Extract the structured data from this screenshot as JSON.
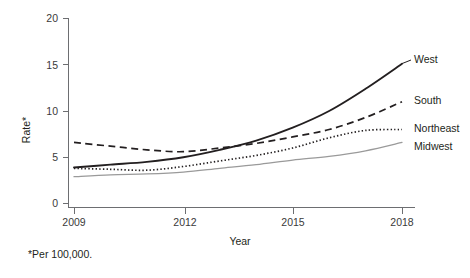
{
  "chart_data": {
    "type": "line",
    "title": "",
    "subtitle": "",
    "xlabel": "Year",
    "ylabel": "Rate*",
    "x": [
      2009,
      2010,
      2011,
      2012,
      2013,
      2014,
      2015,
      2016,
      2017,
      2018
    ],
    "xtick_labels": [
      "2009",
      "2012",
      "2015",
      "2018"
    ],
    "xticks": [
      2009,
      2012,
      2015,
      2018
    ],
    "xlim": [
      2009,
      2018
    ],
    "ytick_labels": [
      "0",
      "5",
      "10",
      "15",
      "20"
    ],
    "yticks": [
      0,
      5,
      10,
      15,
      20
    ],
    "ylim": [
      0,
      20
    ],
    "grid": false,
    "legend_position": "right-inline-labels",
    "footnote": "*Per 100,000.",
    "series": [
      {
        "name": "West",
        "style": "solid",
        "color": "#231f20",
        "values": [
          3.9,
          4.2,
          4.5,
          5.0,
          5.8,
          6.8,
          8.2,
          10.0,
          12.4,
          15.1
        ]
      },
      {
        "name": "South",
        "style": "dashed",
        "color": "#231f20",
        "values": [
          6.6,
          6.2,
          5.8,
          5.6,
          6.0,
          6.5,
          7.2,
          8.0,
          9.3,
          11.0
        ]
      },
      {
        "name": "Northeast",
        "style": "dotted",
        "color": "#231f20",
        "values": [
          3.8,
          3.7,
          3.6,
          4.0,
          4.6,
          5.2,
          6.0,
          7.1,
          7.9,
          8.0
        ]
      },
      {
        "name": "Midwest",
        "style": "solid-light",
        "color": "#9a9a9a",
        "values": [
          2.9,
          3.1,
          3.2,
          3.4,
          3.8,
          4.2,
          4.7,
          5.1,
          5.7,
          6.6
        ]
      }
    ]
  },
  "axes": {
    "y_title": "Rate*",
    "x_title": "Year"
  },
  "labels": {
    "west": "West",
    "south": "South",
    "northeast": "Northeast",
    "midwest": "Midwest"
  },
  "footnote": {
    "text": "*Per 100,000."
  }
}
